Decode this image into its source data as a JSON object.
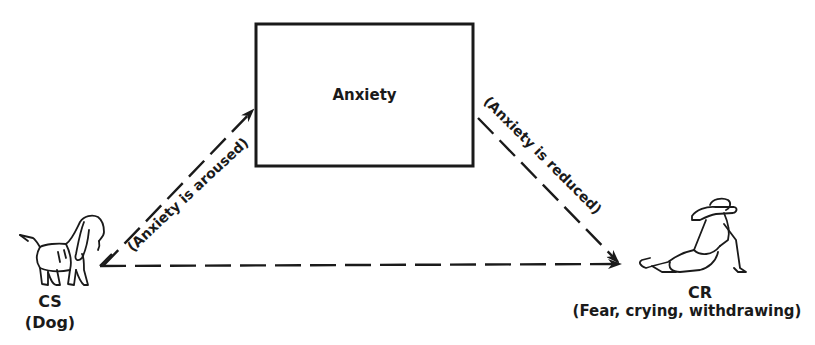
{
  "diagram": {
    "box": {
      "label": "Anxiety"
    },
    "stimulus": {
      "label": "CS",
      "sublabel": "(Dog)",
      "icon": "dog-icon"
    },
    "response": {
      "label": "CR",
      "sublabel": "(Fear, crying, withdrawing)",
      "icon": "withdrawing-child-icon"
    },
    "edges": [
      {
        "from": "CS",
        "to": "Anxiety",
        "label": "(Anxiety is aroused)",
        "style": "dashed"
      },
      {
        "from": "Anxiety",
        "to": "CR",
        "label": "(Anxiety is reduced)",
        "style": "dashed"
      },
      {
        "from": "CS",
        "to": "CR",
        "label": "",
        "style": "dashed"
      }
    ]
  }
}
